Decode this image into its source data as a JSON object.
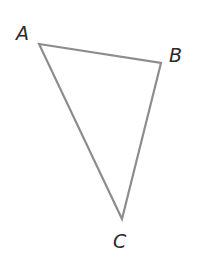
{
  "diagram": {
    "type": "triangle",
    "stroke_color": "#8c8c8c",
    "label_color": "#2a2a2a",
    "vertices": [
      {
        "name": "A",
        "x": 39,
        "y": 44,
        "label_x": 16,
        "label_y": 40
      },
      {
        "name": "B",
        "x": 161,
        "y": 63,
        "label_x": 169,
        "label_y": 62
      },
      {
        "name": "C",
        "x": 122,
        "y": 219,
        "label_x": 113,
        "label_y": 248
      }
    ]
  }
}
